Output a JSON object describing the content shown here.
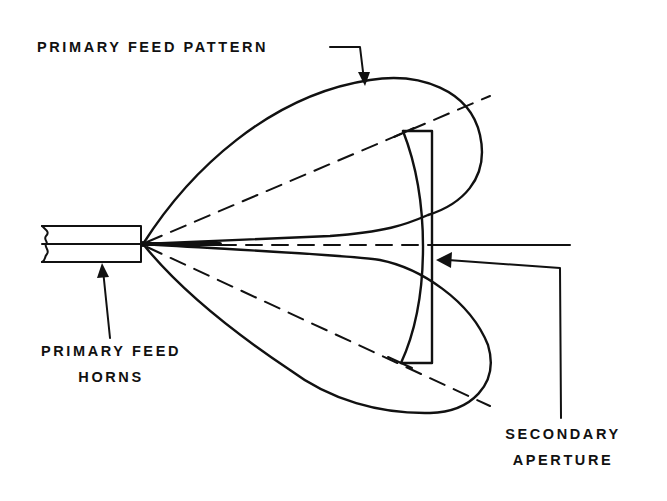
{
  "diagram": {
    "colors": {
      "ink": "#111111",
      "background": "#ffffff"
    },
    "labels": {
      "primary_feed_pattern": "PRIMARY FEED PATTERN",
      "primary_feed_horns_line1": "PRIMARY FEED",
      "primary_feed_horns_line2": "HORNS",
      "secondary_aperture_line1": "SECONDARY",
      "secondary_aperture_line2": "APERTURE"
    },
    "components": [
      {
        "name": "primary-feed-horns",
        "description": "Two stacked rectangular feed horns with broken-off left edge"
      },
      {
        "name": "upper-feed-lobe",
        "description": "Upper teardrop primary feed pattern lobe"
      },
      {
        "name": "lower-feed-lobe",
        "description": "Lower teardrop primary feed pattern lobe"
      },
      {
        "name": "secondary-aperture",
        "description": "Curved lens / reflector aperture shown as tall narrow element"
      },
      {
        "name": "boresight-axis",
        "description": "Central horizontal axis, dashed then solid"
      },
      {
        "name": "upper-beam-axis",
        "description": "Dashed axis of upper lobe"
      },
      {
        "name": "lower-beam-axis",
        "description": "Dashed axis of lower lobe"
      }
    ]
  }
}
